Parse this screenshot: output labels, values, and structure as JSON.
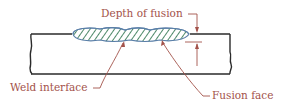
{
  "diagram": {
    "labels": {
      "depth_of_fusion": "Depth of fusion",
      "weld_interface": "Weld interface",
      "fusion_face": "Fusion face"
    },
    "colors": {
      "label": "#a3524a",
      "outline": "#2b2b2b",
      "bead_outline": "#5a7fa8",
      "hatch": "#4f8a6a"
    }
  }
}
